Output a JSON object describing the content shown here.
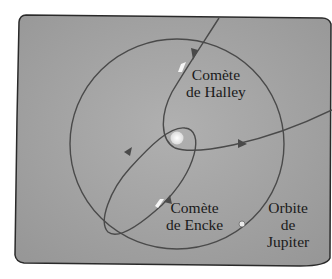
{
  "labels": {
    "halley": [
      "Comète",
      "de Halley"
    ],
    "encke": [
      "Comète",
      "de Encke"
    ],
    "jupiter": [
      "Orbite",
      "de",
      "Jupiter"
    ]
  },
  "colors": {
    "background": "#a6a6a6",
    "orbit": "#4a4a4a",
    "sun": "#f2f2f2",
    "text": "#1a1a1a"
  }
}
